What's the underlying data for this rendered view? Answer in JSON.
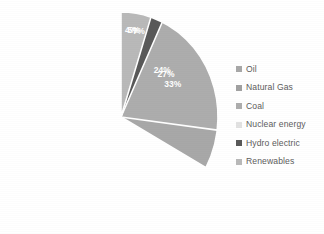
{
  "chart_data": {
    "type": "pie",
    "title": "",
    "categories": [
      "Oil",
      "Natural Gas",
      "Coal",
      "Nuclear energy",
      "Hydro electric",
      "Renewables"
    ],
    "values": [
      33,
      24,
      27,
      4,
      7,
      5
    ],
    "value_labels": [
      "33%",
      "24%",
      "27%",
      "4%",
      "7%",
      "5%"
    ],
    "unit": "%",
    "legend_position": "right",
    "grid": false,
    "start_angle_deg": 0,
    "direction": "clockwise",
    "colors": [
      "#a8a8a8",
      "#a1a1a1",
      "#adadad",
      "#e2e2e2",
      "#595959",
      "#b9b9b9"
    ],
    "label_color": "#ffffff",
    "separator_color": "#ffffff",
    "background": "#ffffff"
  },
  "legend": {
    "items": [
      {
        "label": "Oil",
        "color": "#a8a8a8"
      },
      {
        "label": "Natural Gas",
        "color": "#a1a1a1"
      },
      {
        "label": "Coal",
        "color": "#adadad"
      },
      {
        "label": "Nuclear energy",
        "color": "#e2e2e2"
      },
      {
        "label": "Hydro electric",
        "color": "#595959"
      },
      {
        "label": "Renewables",
        "color": "#b9b9b9"
      }
    ]
  }
}
